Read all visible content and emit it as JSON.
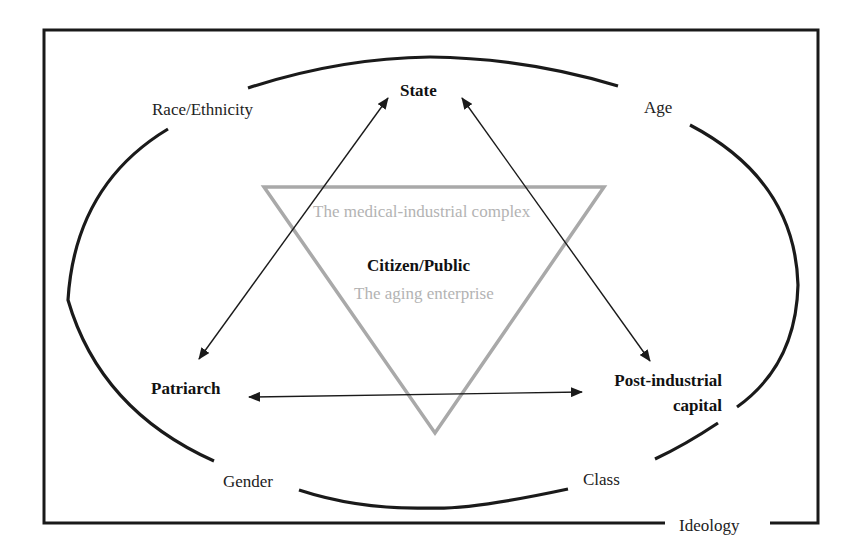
{
  "diagram": {
    "frame_label": "Ideology",
    "ellipse_labels": {
      "top_left": "Race/Ethnicity",
      "top_right": "Age",
      "bottom_left": "Gender",
      "bottom_right": "Class"
    },
    "nodes": {
      "top": "State",
      "left": "Patriarch",
      "right_line1": "Post-industrial",
      "right_line2": "capital",
      "center": "Citizen/Public"
    },
    "triangle_labels": {
      "top": "The medical-industrial complex",
      "bottom": "The aging enterprise"
    },
    "edges": [
      {
        "from": "Patriarch",
        "to": "State",
        "direction": "both"
      },
      {
        "from": "State",
        "to": "Post-industrial capital",
        "direction": "both"
      },
      {
        "from": "Patriarch",
        "to": "Post-industrial capital",
        "direction": "both"
      }
    ],
    "colors": {
      "frame": "#1a1a1a",
      "ellipse": "#1a1a1a",
      "triangle": "#a9a9a9",
      "triangle_text": "#b3b3b3",
      "arrows": "#1a1a1a"
    }
  }
}
